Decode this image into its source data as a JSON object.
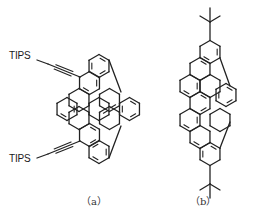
{
  "figure": {
    "structures": [
      {
        "id": "a",
        "caption": "（a）",
        "substituent_label_top": "TIPS",
        "substituent_label_bottom": "TIPS",
        "substituent_type": "TIPS-ethynyl",
        "rings": [
          {
            "cx": 99,
            "cy": 66,
            "doubles": [
              0,
              2,
              4
            ]
          },
          {
            "cx": 89.5,
            "cy": 83,
            "doubles": [
              1,
              3
            ]
          },
          {
            "cx": 67,
            "cy": 109,
            "doubles": [
              1,
              3
            ]
          },
          {
            "cx": 89.5,
            "cy": 135,
            "doubles": [
              0,
              2
            ]
          },
          {
            "cx": 99,
            "cy": 152,
            "doubles": [
              1,
              3,
              5
            ]
          },
          {
            "cx": 129.5,
            "cy": 109,
            "doubles": [
              0,
              2,
              4
            ]
          },
          {
            "cx": 109.5,
            "cy": 100,
            "doubles": [
              2
            ]
          },
          {
            "cx": 109.5,
            "cy": 118,
            "doubles": [
              5
            ]
          },
          {
            "cx": 79,
            "cy": 100,
            "doubles": []
          },
          {
            "cx": 79,
            "cy": 118,
            "doubles": []
          },
          {
            "cx": 99,
            "cy": 109,
            "doubles": []
          }
        ],
        "five_ring_bonds": [
          [
            [
              109,
              60
            ],
            [
              121,
              92
            ]
          ],
          [
            [
              109,
              158
            ],
            [
              121,
              126
            ]
          ]
        ],
        "alkynes": [
          {
            "from": [
              80,
              77
            ],
            "to": [
              48,
              64
            ],
            "label_x": 10,
            "label_y": 56
          },
          {
            "from": [
              80,
              141
            ],
            "to": [
              48,
              154
            ],
            "label_x": 10,
            "label_y": 158
          }
        ]
      },
      {
        "id": "b",
        "caption": "（b）",
        "substituent_type": "tert-butyl",
        "rings": [
          {
            "cx": 210,
            "cy": 52,
            "doubles": [
              1,
              3
            ]
          },
          {
            "cx": 200,
            "cy": 69,
            "doubles": [
              0
            ]
          },
          {
            "cx": 190,
            "cy": 86,
            "doubles": [
              1,
              3
            ]
          },
          {
            "cx": 200,
            "cy": 103,
            "doubles": [
              0,
              2
            ]
          },
          {
            "cx": 190,
            "cy": 120,
            "doubles": [
              1,
              3
            ]
          },
          {
            "cx": 200,
            "cy": 137,
            "doubles": [
              3
            ]
          },
          {
            "cx": 210,
            "cy": 154,
            "doubles": [
              0,
              4
            ]
          },
          {
            "cx": 226,
            "cy": 95,
            "doubles": [
              0,
              2,
              4
            ]
          },
          {
            "cx": 220,
            "cy": 120,
            "doubles": []
          },
          {
            "cx": 210,
            "cy": 86,
            "doubles": []
          }
        ],
        "five_ring_bonds": [
          [
            [
              220,
              58
            ],
            [
              230,
              86
            ]
          ],
          [
            [
              220,
              148
            ],
            [
              230,
              122
            ]
          ]
        ],
        "tbutyl": [
          {
            "attach": [
              210,
              40
            ],
            "center": [
              210,
              22
            ],
            "arms": [
              [
                200,
                16
              ],
              [
                220,
                16
              ],
              [
                210,
                8
              ]
            ]
          },
          {
            "attach": [
              210,
              166
            ],
            "center": [
              210,
              184
            ],
            "arms": [
              [
                200,
                190
              ],
              [
                220,
                190
              ],
              [
                210,
                198
              ]
            ]
          }
        ]
      }
    ],
    "style": {
      "bond_color": "#222222",
      "background": "#ffffff",
      "hex_side": 11.5
    }
  }
}
